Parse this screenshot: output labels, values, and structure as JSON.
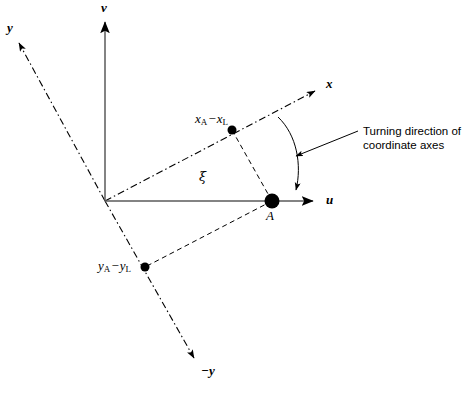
{
  "figure": {
    "type": "technical-diagram",
    "width": 468,
    "height": 394,
    "background_color": "#ffffff",
    "line_color": "#000000"
  },
  "axes": {
    "u": {
      "label": "u",
      "style": "solid",
      "description": "horizontal axis pointing right",
      "origin": [
        105,
        201
      ],
      "tip": [
        318,
        201
      ],
      "label_pos": [
        327,
        194
      ]
    },
    "v": {
      "label": "v",
      "style": "solid",
      "description": "vertical axis pointing up",
      "origin": [
        105,
        201
      ],
      "tip": [
        105,
        18
      ],
      "label_pos": [
        101,
        2
      ]
    },
    "x": {
      "label": "x",
      "style": "dash-dot",
      "description": "rotated axis pointing up-right",
      "origin": [
        105,
        201
      ],
      "tip": [
        320,
        88
      ],
      "label_pos": [
        327,
        79
      ]
    },
    "y": {
      "label": "y",
      "style": "dash-dot",
      "description": "rotated axis pointing up-left",
      "origin": [
        105,
        201
      ],
      "tip": [
        16,
        38
      ],
      "label_pos": [
        8,
        22
      ]
    },
    "minus_y": {
      "label": "−y",
      "style": "dash-dot",
      "description": "negative rotated y axis pointing down-right",
      "origin": [
        105,
        201
      ],
      "tip": [
        197,
        363
      ],
      "label_pos": [
        203,
        364
      ]
    }
  },
  "angle": {
    "symbol": "ξ",
    "name": "xi",
    "meaning": "rotation angle between u axis and x axis",
    "label_pos": [
      199,
      170
    ]
  },
  "points": {
    "A": {
      "label": "A",
      "marker": "large-filled-circle",
      "radius": 7,
      "pos": [
        272,
        201
      ],
      "label_pos": [
        267,
        208
      ]
    },
    "x_component": {
      "label": "xₖ − xₗ",
      "label_text": "x",
      "sub1": "A",
      "minus": "−",
      "label_text2": "x",
      "sub2": "L",
      "marker": "filled-circle",
      "radius": 4.5,
      "pos": [
        232,
        130
      ],
      "label_pos": [
        196,
        113
      ],
      "description": "projection of A on rotated x axis"
    },
    "y_component": {
      "label": "yₖ − yₗ",
      "label_text": "y",
      "sub1": "A",
      "minus": "−",
      "label_text2": "y",
      "sub2": "L",
      "marker": "filled-circle",
      "radius": 4.5,
      "pos": [
        145,
        267
      ],
      "label_pos": [
        99,
        259
      ],
      "description": "projection of A on negative rotated y axis"
    }
  },
  "construction_lines": {
    "style": "dashed",
    "segments": [
      {
        "name": "x-component-to-A",
        "from": [
          232,
          130
        ],
        "to": [
          272,
          201
        ]
      },
      {
        "name": "A-to-y-component",
        "from": [
          272,
          201
        ],
        "to": [
          145,
          267
        ]
      }
    ]
  },
  "callout": {
    "text_line_1": "Turning direction of",
    "text_line_2": "coordinate axes",
    "leader_from": [
      358,
      131
    ],
    "leader_to": [
      293,
      157
    ],
    "arc": {
      "from": [
        278,
        117
      ],
      "to": [
        296,
        196
      ],
      "description": "curved arrow from x axis sweeping down to u axis"
    }
  },
  "caption_sliver": {
    "text": ""
  }
}
